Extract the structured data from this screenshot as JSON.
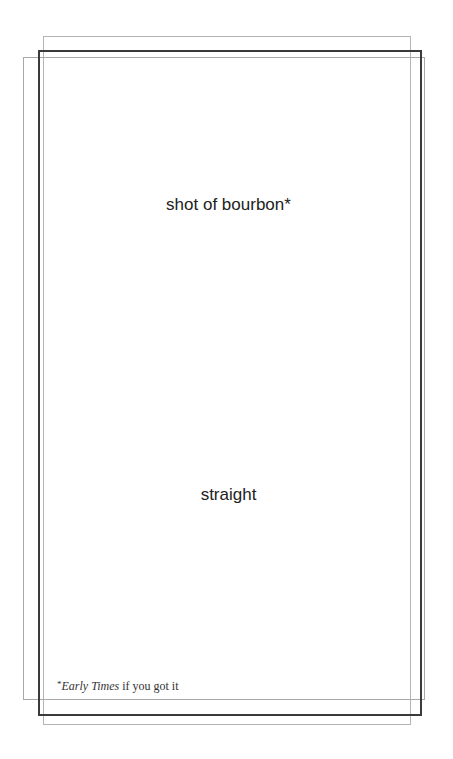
{
  "card": {
    "main_text": "shot of bourbon*",
    "sub_text": "straight",
    "footnote": {
      "mark": "*",
      "brand": "Early Times",
      "rest": " if you got it"
    }
  },
  "colors": {
    "frame_dark": "#3a3a3a",
    "frame_light": "#b4b4b4",
    "text": "#222222"
  }
}
